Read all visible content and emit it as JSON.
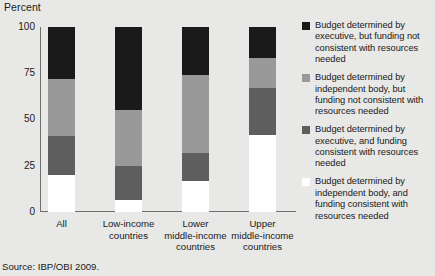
{
  "chart_data": {
    "type": "bar",
    "subtype": "stacked-vertical-100",
    "title": "",
    "xlabel": "",
    "ylabel": "Percent",
    "ylim": [
      0,
      100
    ],
    "yticks": [
      0,
      25,
      50,
      75,
      100
    ],
    "ytick_labels": [
      "0",
      "25",
      "50",
      "75",
      "100"
    ],
    "grid": false,
    "legend_position": "right",
    "categories": [
      "All",
      "Low-income\ncountries",
      "Lower\nmiddle-income\ncountries",
      "Upper\nmiddle-income\ncountries"
    ],
    "series": [
      {
        "name": "Budget determined by independent body, and funding consistent with resources needed",
        "color": "#ffffff",
        "values": [
          20,
          6.5,
          17,
          41.5
        ]
      },
      {
        "name": "Budget determined by executive, and funding consistent with resources needed",
        "color": "#5e5e5e",
        "values": [
          21,
          18.5,
          15,
          25.5
        ]
      },
      {
        "name": "Budget determined by independent body, but funding not consistent with resources needed",
        "color": "#999999",
        "values": [
          31,
          30,
          42,
          16
        ]
      },
      {
        "name": "Budget determined by executive, but funding not consistent with resources needed",
        "color": "#1a1a1a",
        "values": [
          28,
          45,
          26,
          17
        ]
      }
    ],
    "source": "Source: IBP/OBI 2009."
  },
  "axis": {
    "y_unit_label": "Percent",
    "ticks": [
      {
        "label": "100",
        "value": 100
      },
      {
        "label": "75",
        "value": 75
      },
      {
        "label": "50",
        "value": 50
      },
      {
        "label": "25",
        "value": 25
      },
      {
        "label": "0",
        "value": 0
      }
    ]
  },
  "legend": {
    "items": [
      {
        "color": "#1a1a1a",
        "label": "Budget determined by executive, but funding not consistent with resources needed"
      },
      {
        "color": "#999999",
        "label": "Budget determined by independent body, but funding not consistent with resources needed"
      },
      {
        "color": "#5e5e5e",
        "label": "Budget determined by executive, and funding consistent with resources needed"
      },
      {
        "color": "#ffffff",
        "label": "Budget determined by independent body, and funding consistent with resources needed"
      }
    ]
  },
  "footer": {
    "source": "Source: IBP/OBI 2009."
  },
  "colors": {
    "background": "#e8e8e6",
    "axis": "#6e6e6e",
    "text": "#1a1a1a"
  }
}
